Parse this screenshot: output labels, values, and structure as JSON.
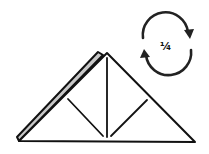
{
  "diagram": {
    "type": "origami-step",
    "rotation_symbol": {
      "icon": "rotate-clockwise-icon",
      "label": "¼"
    },
    "colors": {
      "stroke": "#111111",
      "back_layer": "#c8c8c8",
      "paper": "#ffffff"
    }
  }
}
